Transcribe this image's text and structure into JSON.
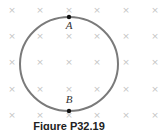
{
  "figure": {
    "caption": "Figure P32.19",
    "field_symbol": "×",
    "field_description": "uniform magnetic field directed into the page",
    "grid": {
      "columns_x": [
        12,
        40,
        69,
        97,
        126,
        155
      ],
      "rows_y": [
        10,
        36,
        62,
        89,
        115
      ]
    },
    "loop": {
      "shape": "circle",
      "center": [
        69,
        64
      ],
      "rx": 49,
      "ry": 47,
      "color": "#7a7a7a"
    },
    "points": [
      {
        "label": "A",
        "x": 69,
        "y": 17,
        "label_y": 29
      },
      {
        "label": "B",
        "x": 69,
        "y": 111,
        "label_y": 103
      }
    ],
    "colors": {
      "cross": "#c4c4c4",
      "loop": "#7a7a7a",
      "point": "#111111"
    }
  }
}
